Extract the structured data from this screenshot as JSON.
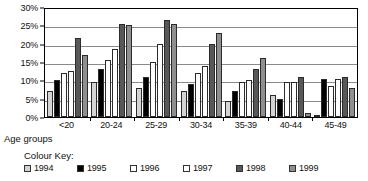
{
  "chart_data": {
    "type": "bar",
    "title": "",
    "xlabel": "Age groups",
    "ylabel": "",
    "ylim": [
      0,
      30
    ],
    "y_ticks": [
      "0%",
      "5%",
      "10%",
      "15%",
      "20%",
      "25%",
      "30%"
    ],
    "y_tick_values": [
      0,
      5,
      10,
      15,
      20,
      25,
      30
    ],
    "grid": true,
    "legend_position": "below",
    "legend_title": "Colour Key:",
    "categories": [
      "<20",
      "20-24",
      "25-29",
      "30-34",
      "35-39",
      "40-44",
      "45-49"
    ],
    "series": [
      {
        "name": "1994",
        "color": "#d4d4d4",
        "values": [
          7,
          9.5,
          8,
          7,
          4.5,
          6,
          0.5
        ]
      },
      {
        "name": "1995",
        "color": "#000000",
        "values": [
          10,
          13,
          11,
          9,
          7,
          5,
          10.5
        ]
      },
      {
        "name": "1996",
        "color": "#fdfdfd",
        "values": [
          12,
          15.5,
          15,
          12,
          9.5,
          9.5,
          8.5
        ]
      },
      {
        "name": "1997",
        "color": "#ffffff",
        "values": [
          12.5,
          18.5,
          20,
          14,
          10,
          9.5,
          10.5
        ]
      },
      {
        "name": "1998",
        "color": "#585858",
        "values": [
          21.5,
          25.5,
          26.5,
          20,
          13,
          11,
          11
        ]
      },
      {
        "name": "1999",
        "color": "#8f8f8f",
        "values": [
          17,
          25,
          25.5,
          23,
          16,
          1,
          8
        ]
      }
    ]
  },
  "axis": {
    "x_title": "Age groups"
  },
  "legend": {
    "title": "Colour Key:",
    "items": [
      {
        "label": "1994"
      },
      {
        "label": "1995"
      },
      {
        "label": "1996"
      },
      {
        "label": "1997"
      },
      {
        "label": "1998"
      },
      {
        "label": "1999"
      }
    ]
  }
}
